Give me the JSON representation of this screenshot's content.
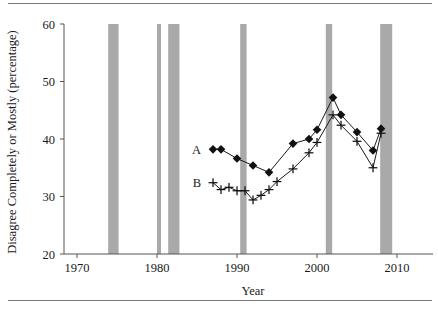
{
  "chart_data": {
    "type": "line",
    "title": "",
    "xlabel": "Year",
    "ylabel": "Disagree Completely or Mostly (percentage)",
    "xlim": [
      1968,
      2012
    ],
    "ylim": [
      20,
      60
    ],
    "xticks": [
      1970,
      1980,
      1990,
      2000,
      2010
    ],
    "xtick_labels": [
      "1970",
      "1980",
      "1990",
      "2000",
      "2010"
    ],
    "yticks": [
      20,
      30,
      40,
      50,
      60
    ],
    "ytick_labels": [
      "20",
      "30",
      "40",
      "50",
      "60"
    ],
    "grid": false,
    "legend_position": "inside-left",
    "series": [
      {
        "name": "A",
        "label": "A",
        "marker": "diamond",
        "x": [
          1987,
          1988,
          1990,
          1992,
          1994,
          1997,
          1999,
          2000,
          2002,
          2003,
          2005,
          2007,
          2008
        ],
        "values": [
          38.2,
          38.2,
          36.6,
          35.4,
          34.2,
          39.2,
          40.0,
          41.6,
          47.2,
          44.2,
          41.2,
          38.0,
          41.8
        ]
      },
      {
        "name": "B",
        "label": "B",
        "marker": "plus",
        "x": [
          1987,
          1988,
          1989,
          1990,
          1991,
          1992,
          1993,
          1994,
          1995,
          1997,
          1999,
          2000,
          2002,
          2003,
          2005,
          2007,
          2008
        ],
        "values": [
          32.4,
          31.2,
          31.6,
          31.0,
          31.0,
          29.4,
          30.2,
          31.2,
          32.6,
          34.8,
          37.6,
          39.4,
          44.2,
          42.4,
          39.6,
          35.0,
          41.0
        ]
      }
    ],
    "recession_bands": [
      {
        "start": 1973.9,
        "end": 1975.2
      },
      {
        "start": 1980.0,
        "end": 1980.5
      },
      {
        "start": 1981.4,
        "end": 1982.8
      },
      {
        "start": 1990.4,
        "end": 1991.2
      },
      {
        "start": 2001.1,
        "end": 2001.9
      },
      {
        "start": 2007.9,
        "end": 2009.4
      }
    ],
    "colors": {
      "marker": "#111111",
      "line": "#1a1a1a",
      "recession_band": "#a9a9a9",
      "axis": "#555555",
      "rule": "#7a7a7a",
      "background": "#ffffff"
    }
  }
}
